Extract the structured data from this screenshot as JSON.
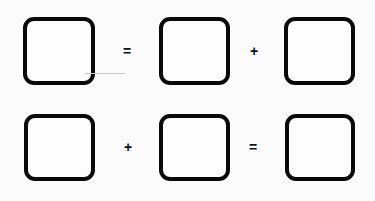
{
  "worksheet": {
    "rows": [
      {
        "boxes": [
          {
            "value": ""
          },
          {
            "value": ""
          },
          {
            "value": ""
          }
        ],
        "operators": [
          "=",
          "+"
        ]
      },
      {
        "boxes": [
          {
            "value": ""
          },
          {
            "value": ""
          },
          {
            "value": ""
          }
        ],
        "operators": [
          "+",
          "="
        ]
      }
    ]
  },
  "colors": {
    "background": "#fbfbfb",
    "box_border": "#0a0a0a",
    "operator": "#111111"
  }
}
